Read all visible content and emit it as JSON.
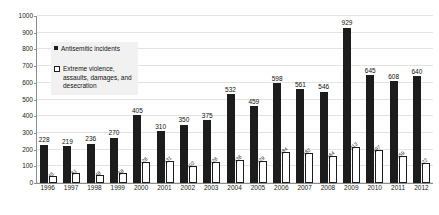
{
  "chart_data": {
    "type": "bar",
    "title": "",
    "xlabel": "",
    "ylabel": "",
    "ylim": [
      0,
      1000
    ],
    "ytick_step": 100,
    "yticks": [
      0,
      100,
      200,
      300,
      400,
      500,
      600,
      700,
      800,
      900,
      1000
    ],
    "grid": true,
    "legend_position": "inside-upper-left",
    "categories": [
      "1996",
      "1997",
      "1998",
      "1999",
      "2000",
      "2001",
      "2002",
      "2003",
      "2004",
      "2005",
      "2006",
      "2007",
      "2008",
      "2009",
      "2010",
      "2011",
      "2012"
    ],
    "series": [
      {
        "name": "Antisemitic incidents",
        "color": "#1c1c1c",
        "values": [
          228,
          219,
          236,
          270,
          405,
          310,
          350,
          375,
          532,
          459,
          598,
          561,
          546,
          929,
          645,
          608,
          640
        ]
      },
      {
        "name": "Extreme violence, assaults, damages, and desecration",
        "color": "#ffffff",
        "values": [
          45,
          61,
          48,
          58,
          126,
          131,
          102,
          126,
          136,
          129,
          184,
          182,
          164,
          213,
          197,
          159,
          122
        ]
      }
    ]
  },
  "legend": {
    "entries": [
      {
        "label": "Antisemitic incidents",
        "swatch": "filled-square"
      },
      {
        "label": "Extreme violence,\nassaults, damages, and\ndesecration",
        "swatch": "hollow-square"
      }
    ]
  }
}
